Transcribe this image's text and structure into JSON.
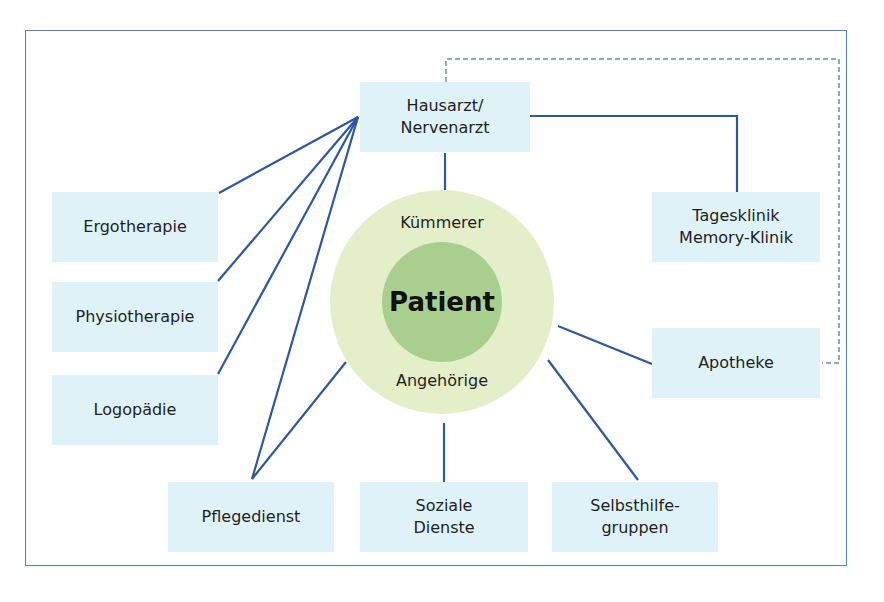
{
  "diagram": {
    "center": {
      "title": "Patient",
      "ring_top_label": "Kümmerer",
      "ring_bottom_label": "Angehörige"
    },
    "nodes": {
      "hausarzt": {
        "line1": "Hausarzt/",
        "line2": "Nervenarzt"
      },
      "ergotherapie": {
        "label": "Ergotherapie"
      },
      "physiotherapie": {
        "label": "Physiotherapie"
      },
      "logopaedie": {
        "label": "Logopädie"
      },
      "tagesklinik": {
        "line1": "Tagesklinik",
        "line2": "Memory-Klinik"
      },
      "apotheke": {
        "label": "Apotheke"
      },
      "pflegedienst": {
        "label": "Pflegedienst"
      },
      "soziale_dienste": {
        "line1": "Soziale",
        "line2": "Dienste"
      },
      "selbsthilfe": {
        "line1": "Selbsthilfe-",
        "line2": "gruppen"
      }
    },
    "connections": [
      {
        "from": "Hausarzt/Nervenarzt",
        "to": "Ergotherapie",
        "style": "solid"
      },
      {
        "from": "Hausarzt/Nervenarzt",
        "to": "Physiotherapie",
        "style": "solid"
      },
      {
        "from": "Hausarzt/Nervenarzt",
        "to": "Logopädie",
        "style": "solid"
      },
      {
        "from": "Hausarzt/Nervenarzt",
        "to": "Pflegedienst",
        "style": "solid"
      },
      {
        "from": "Hausarzt/Nervenarzt",
        "to": "Patient",
        "style": "solid"
      },
      {
        "from": "Hausarzt/Nervenarzt",
        "to": "Tagesklinik Memory-Klinik",
        "style": "solid"
      },
      {
        "from": "Hausarzt/Nervenarzt",
        "to": "Apotheke",
        "style": "dashed"
      },
      {
        "from": "Patient",
        "to": "Pflegedienst",
        "style": "solid"
      },
      {
        "from": "Patient",
        "to": "Soziale Dienste",
        "style": "solid"
      },
      {
        "from": "Patient",
        "to": "Selbsthilfegruppen",
        "style": "solid"
      },
      {
        "from": "Patient",
        "to": "Apotheke",
        "style": "solid"
      }
    ],
    "colors": {
      "frame": "#5b7fb8",
      "line": "#2a57a8",
      "dashed_line": "#8fa8cc",
      "node_fill": "#dff2f7",
      "outer_circle": "#e4efc9",
      "inner_circle": "#a9cf8f"
    }
  }
}
